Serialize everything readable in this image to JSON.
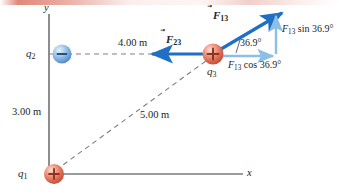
{
  "figure": {
    "axes": {
      "x_label": "x",
      "y_label": "y"
    },
    "charges": [
      {
        "name": "q1",
        "label": "q",
        "index": "1",
        "sign": "+",
        "polarity": "positive",
        "color": "#e06a56"
      },
      {
        "name": "q2",
        "label": "q",
        "index": "2",
        "sign": "−",
        "polarity": "negative",
        "color": "#79a9dd"
      },
      {
        "name": "q3",
        "label": "q",
        "index": "3",
        "sign": "+",
        "polarity": "positive",
        "color": "#e06a56"
      }
    ],
    "distances": [
      {
        "name": "q1-to-q2",
        "value": "3.00 m"
      },
      {
        "name": "q2-to-q3",
        "value": "4.00 m"
      },
      {
        "name": "q1-to-q3",
        "value": "5.00 m"
      }
    ],
    "vectors": [
      {
        "name": "F13",
        "symbol": "F",
        "index": "13",
        "arrow": "⃗",
        "color": "#1f6fc4",
        "direction": "up-right"
      },
      {
        "name": "F23",
        "symbol": "F",
        "index": "23",
        "arrow": "⃗",
        "color": "#1f6fc4",
        "direction": "left"
      }
    ],
    "components": [
      {
        "name": "F13-sin-component",
        "text": "F",
        "index": "13",
        "expr": " sin 36.9°",
        "color": "#7fb8e6"
      },
      {
        "name": "F13-cos-component",
        "text": "F",
        "index": "13",
        "expr": " cos 36.9°",
        "color": "#7fb8e6"
      }
    ],
    "angle": {
      "name": "theta",
      "value": "36.9°"
    },
    "colors": {
      "vector_dark_blue": "#1f6fc4",
      "component_light_blue": "#7fb8e6",
      "axis_gray": "#7a7a7a",
      "dashed_gray": "#808080",
      "text": "#231f20",
      "positive_charge": "#e06a56",
      "negative_charge": "#79a9dd"
    }
  }
}
